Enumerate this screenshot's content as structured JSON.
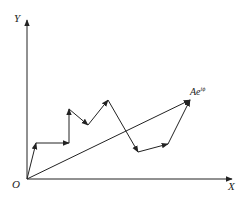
{
  "diagram": {
    "axes": {
      "x_label": "X",
      "y_label": "Y",
      "origin_label": "O"
    },
    "resultant": {
      "label_base": "Ae",
      "label_exp": "iϕ"
    },
    "origin": [
      27,
      179
    ],
    "path_vertices": [
      [
        27,
        179
      ],
      [
        36,
        143
      ],
      [
        69,
        143
      ],
      [
        69,
        109
      ],
      [
        88,
        125
      ],
      [
        108,
        100
      ],
      [
        138,
        152
      ],
      [
        168,
        144
      ],
      [
        190,
        100
      ]
    ],
    "resultant_end": [
      190,
      100
    ],
    "colors": {
      "stroke": "#222222",
      "background": "#ffffff"
    }
  }
}
